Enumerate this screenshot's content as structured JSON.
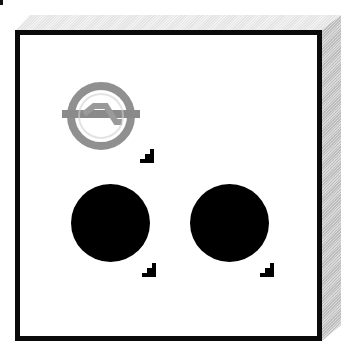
{
  "panel": {
    "title": "",
    "items": [
      {
        "icon": "signal-ring-icon",
        "state": "disabled",
        "color": "#8a8a8a",
        "has_corner_marker": true
      },
      {
        "icon": "black-dot-icon",
        "state": "active",
        "color": "#000000",
        "has_corner_marker": true
      },
      {
        "icon": "black-dot-icon",
        "state": "active",
        "color": "#000000",
        "has_corner_marker": true
      }
    ]
  },
  "colors": {
    "frame_border": "#0a0a0a",
    "frame_fill": "#ffffff",
    "bevel_top": "#ececec",
    "bevel_side": "#cccccc",
    "icon_gray": "#8a8a8a"
  }
}
